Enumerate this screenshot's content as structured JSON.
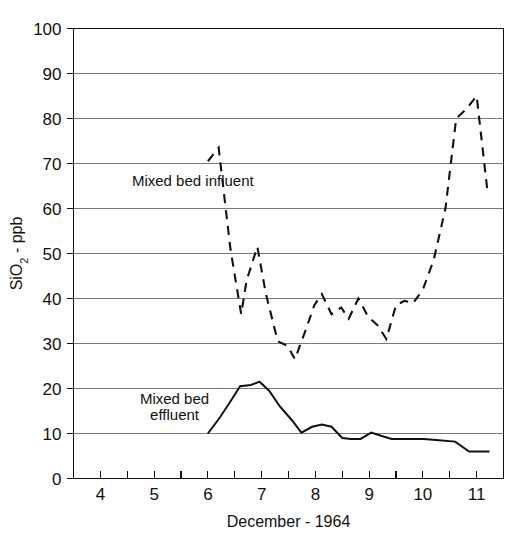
{
  "chart_data": {
    "type": "line",
    "title": "",
    "xlabel": "December - 1964",
    "ylabel": "SiO2 - ppb",
    "ylabel_parts": {
      "prefix": "SiO",
      "sub": "2",
      "suffix": " - ppb"
    },
    "xlim": [
      3.5,
      11.5
    ],
    "ylim": [
      0,
      100
    ],
    "grid": "horizontal",
    "legend_position": "inline-annotation",
    "x_ticks": [
      4,
      5,
      6,
      7,
      8,
      9,
      10,
      11
    ],
    "x_tick_labels": [
      "4",
      "5",
      "6",
      "7",
      "8",
      "9",
      "10",
      "11"
    ],
    "x_minor_ticks": [
      4.5,
      5.5,
      6.5,
      7.5,
      8.5,
      9.5,
      10.5
    ],
    "y_ticks": [
      0,
      10,
      20,
      30,
      40,
      50,
      60,
      70,
      80,
      90,
      100
    ],
    "y_tick_labels": [
      "0",
      "10",
      "20",
      "30",
      "40",
      "50",
      "60",
      "70",
      "80",
      "90",
      "100"
    ],
    "y_gridline_values": [
      10,
      20,
      30,
      40,
      50,
      60,
      70,
      80,
      90,
      100
    ],
    "series": [
      {
        "name": "Mixed bed influent",
        "style": "dashed",
        "x": [
          6.0,
          6.2,
          6.42,
          6.62,
          6.72,
          6.92,
          7.08,
          7.3,
          7.48,
          7.62,
          7.82,
          7.98,
          8.12,
          8.3,
          8.48,
          8.62,
          8.8,
          8.98,
          9.16,
          9.32,
          9.5,
          9.66,
          9.82,
          10.0,
          10.2,
          10.42,
          10.62,
          10.8,
          11.0,
          11.2
        ],
        "y": [
          70.5,
          73.5,
          51.0,
          36.5,
          44.0,
          51.5,
          41.0,
          30.5,
          29.5,
          26.5,
          33.0,
          38.5,
          41.0,
          36.5,
          38.0,
          35.5,
          40.0,
          36.0,
          34.0,
          31.0,
          38.5,
          39.5,
          39.0,
          42.0,
          48.5,
          60.0,
          80.0,
          82.0,
          85.0,
          64.0
        ]
      },
      {
        "name": "Mixed bed effluent",
        "style": "solid",
        "x": [
          6.0,
          6.22,
          6.44,
          6.6,
          6.8,
          6.96,
          7.14,
          7.34,
          7.56,
          7.74,
          7.94,
          8.12,
          8.3,
          8.5,
          8.66,
          8.84,
          9.04,
          9.22,
          9.42,
          9.62,
          9.82,
          10.02,
          10.3,
          10.6,
          10.86,
          11.06,
          11.24
        ],
        "y": [
          10.0,
          13.5,
          17.5,
          20.5,
          20.8,
          21.5,
          19.5,
          16.0,
          13.0,
          10.2,
          11.5,
          12.0,
          11.5,
          9.0,
          8.8,
          8.8,
          10.2,
          9.5,
          8.8,
          8.8,
          8.8,
          8.8,
          8.5,
          8.2,
          6.0,
          6.0,
          6.0
        ]
      }
    ],
    "annotations": [
      {
        "text": "Mixed bed influent",
        "x": 5.72,
        "y": 65.0,
        "anchor": "middle"
      },
      {
        "text": "Mixed bed",
        "x": 5.38,
        "y": 16.5,
        "anchor": "middle"
      },
      {
        "text": "effluent",
        "x": 5.38,
        "y": 13.0,
        "anchor": "middle"
      }
    ]
  }
}
